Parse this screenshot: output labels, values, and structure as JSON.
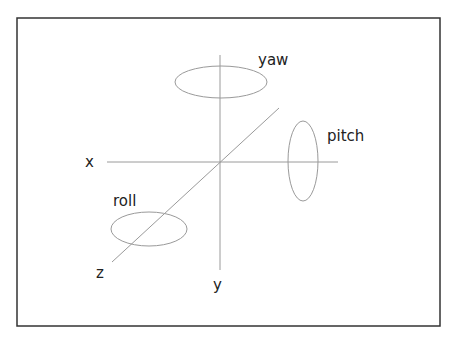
{
  "diagram": {
    "axes": {
      "x": {
        "label": "x"
      },
      "y": {
        "label": "y"
      },
      "z": {
        "label": "z"
      }
    },
    "rotations": {
      "yaw": {
        "label": "yaw",
        "about_axis": "y"
      },
      "pitch": {
        "label": "pitch",
        "about_axis": "x"
      },
      "roll": {
        "label": "roll",
        "about_axis": "z"
      }
    },
    "colors": {
      "frame": "#333333",
      "lines": "#9a9a9a",
      "text": "#222222"
    }
  }
}
